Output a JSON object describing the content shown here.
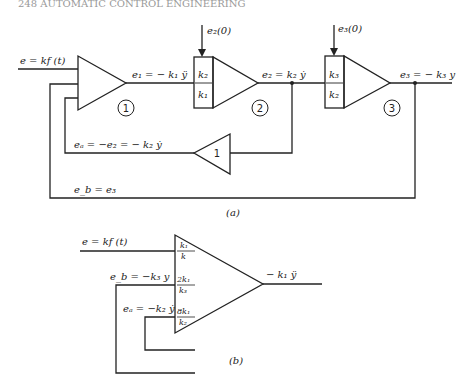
{
  "header": {
    "text": "248  AUTOMATIC CONTROL ENGINEERING"
  },
  "diagram_a": {
    "caption": "(a)",
    "input_label": "e = kf (t)",
    "amp1": {
      "number": "1"
    },
    "e1_label": "e₁ = − k₁ ÿ",
    "integrator2": {
      "number": "2",
      "gain_num": "k₂",
      "gain_den": "k₁",
      "ic": "e₂(0)"
    },
    "e2_label": "e₂ = k₂ ẏ",
    "integrator3": {
      "number": "3",
      "gain_num": "k₃",
      "gain_den": "k₂",
      "ic": "e₃(0)"
    },
    "e3_label": "e₃ = − k₃ y",
    "inverter": {
      "gain": "1"
    },
    "ea_label": "eₐ = −e₂ = − k₂ ẏ",
    "eb_label": "e_b = e₃"
  },
  "diagram_b": {
    "caption": "(b)",
    "input_label": "e = kf (t)",
    "eb_label": "e_b = −k₃ y",
    "ea_label": "eₐ = −k₂ ẏ",
    "gains": [
      {
        "num": "k₁",
        "den": "k"
      },
      {
        "num": "2k₁",
        "den": "k₃"
      },
      {
        "num": "8k₁",
        "den": "k₂"
      }
    ],
    "output_label": "− k₁ ÿ"
  }
}
